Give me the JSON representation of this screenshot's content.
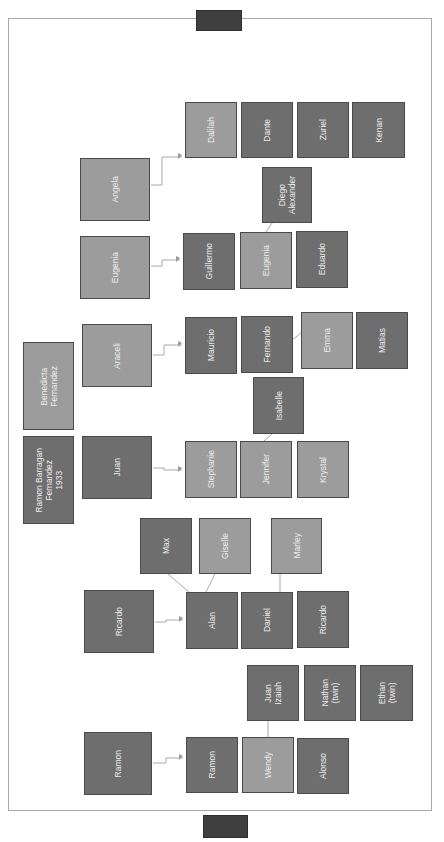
{
  "diagram": {
    "type": "family-tree",
    "orientation": "rotated-90",
    "colors": {
      "dark_node": "#6e6e6e",
      "light_node": "#9c9c9c",
      "connector": "#aaaaaa",
      "frame": "#a9a9a9",
      "tab": "#3f3f3f"
    },
    "root": {
      "couple": [
        {
          "id": "ramon-barragan",
          "label": "Ramon Barragan\nFernandez\n1933",
          "shade": "dark"
        },
        {
          "id": "bernadeta",
          "label": "Benedicta\nFernandez",
          "shade": "light"
        }
      ]
    },
    "families": [
      {
        "parent": {
          "label": "Angela",
          "shade": "light"
        },
        "children": [
          {
            "label": "Dalilah",
            "shade": "light"
          },
          {
            "label": "Dante",
            "shade": "dark"
          },
          {
            "label": "Zuriel",
            "shade": "dark"
          },
          {
            "label": "Kenan",
            "shade": "dark"
          }
        ]
      },
      {
        "parent": {
          "label": "Eugenia",
          "shade": "light"
        },
        "children": [
          {
            "label": "Guillermo",
            "shade": "dark"
          },
          {
            "label": "Eugenia",
            "shade": "light",
            "children": [
              {
                "label": "Diego\nAlexander",
                "shade": "dark"
              }
            ]
          },
          {
            "label": "Eduardo",
            "shade": "dark"
          }
        ]
      },
      {
        "parent": {
          "label": "Araceli",
          "shade": "light"
        },
        "children": [
          {
            "label": "Mauricio",
            "shade": "dark"
          },
          {
            "label": "Fernando",
            "shade": "dark",
            "children": [
              {
                "label": "Emma",
                "shade": "light"
              },
              {
                "label": "Matias",
                "shade": "dark"
              }
            ]
          }
        ]
      },
      {
        "parent": {
          "label": "Juan",
          "shade": "dark"
        },
        "children": [
          {
            "label": "Stephanie",
            "shade": "light"
          },
          {
            "label": "Jennifer",
            "shade": "light",
            "children": [
              {
                "label": "Isabelle",
                "shade": "dark"
              }
            ]
          },
          {
            "label": "Krystal",
            "shade": "light"
          }
        ]
      },
      {
        "parent": {
          "label": "Ricardo",
          "shade": "dark"
        },
        "children": [
          {
            "label": "Alan",
            "shade": "dark",
            "children": [
              {
                "label": "Max",
                "shade": "dark"
              },
              {
                "label": "Giselle",
                "shade": "light"
              }
            ]
          },
          {
            "label": "Daniel",
            "shade": "dark",
            "children": [
              {
                "label": "Marley",
                "shade": "light"
              }
            ]
          },
          {
            "label": "Ricardo",
            "shade": "dark"
          }
        ]
      },
      {
        "parent": {
          "label": "Ramon",
          "shade": "dark"
        },
        "children": [
          {
            "label": "Ramon",
            "shade": "dark"
          },
          {
            "label": "Wendy",
            "shade": "light",
            "children": [
              {
                "label": "Juan\nIzaiah",
                "shade": "dark"
              }
            ]
          },
          {
            "label": "Alonso",
            "shade": "dark"
          }
        ]
      }
    ],
    "extra_nodes": [
      {
        "label": "Nathan\n(twin)",
        "shade": "dark"
      },
      {
        "label": "Ethan\n(twin)",
        "shade": "dark"
      }
    ]
  },
  "nodes": {
    "dalilah": "Dalilah",
    "dante": "Dante",
    "zuriel": "Zuriel",
    "kenan": "Kenan",
    "angela": "Angela",
    "diego": "Diego\nAlexander",
    "eugenia_parent": "Eugenia",
    "guillermo": "Guillermo",
    "eugenia": "Eugenia",
    "eduardo": "Eduardo",
    "araceli": "Araceli",
    "mauricio": "Mauricio",
    "fernando": "Fernando",
    "emma": "Emma",
    "matias": "Matias",
    "bernadeta": "Benedicta\nFernandez",
    "isabelle": "Isabelle",
    "ramon_barragan": "Ramon Barragan\nFernandez\n1933",
    "juan": "Juan",
    "stephanie": "Stephanie",
    "jennifer": "Jennifer",
    "krystal": "Krystal",
    "max": "Max",
    "giselle": "Giselle",
    "marley": "Marley",
    "ricardo_parent": "Ricardo",
    "alan": "Alan",
    "daniel": "Daniel",
    "ricardo": "Ricardo",
    "juan_izaiah": "Juan\nIzaiah",
    "nathan": "Nathan\n(twin)",
    "ethan": "Ethan\n(twin)",
    "ramon_parent": "Ramon",
    "ramon": "Ramon",
    "wendy": "Wendy",
    "alonso": "Alonso"
  }
}
